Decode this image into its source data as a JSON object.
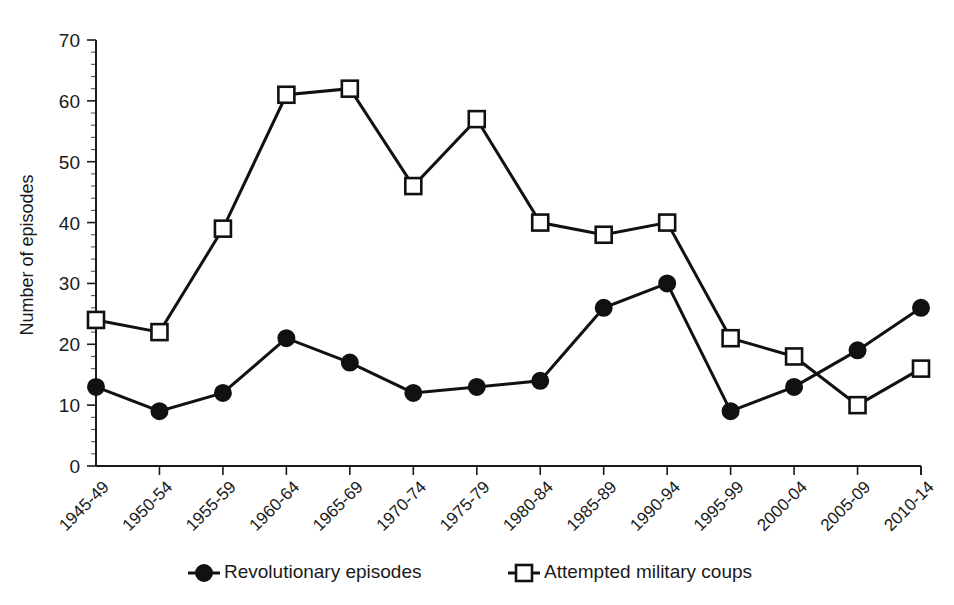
{
  "chart_data": {
    "type": "line",
    "title": "",
    "xlabel": "",
    "ylabel": "Number of episodes",
    "ylim": [
      0,
      70
    ],
    "y_ticks": [
      0,
      10,
      20,
      30,
      40,
      50,
      60,
      70
    ],
    "y_minor_tick_step": 2,
    "grid": false,
    "legend_position": "bottom",
    "categories": [
      "1945-49",
      "1950-54",
      "1955-59",
      "1960-64",
      "1965-69",
      "1970-74",
      "1975-79",
      "1980-84",
      "1985-89",
      "1990-94",
      "1995-99",
      "2000-04",
      "2005-09",
      "2010-14"
    ],
    "series": [
      {
        "name": "Revolutionary episodes",
        "marker": "filled-circle",
        "values": [
          13,
          9,
          12,
          21,
          17,
          12,
          13,
          14,
          26,
          30,
          9,
          13,
          19,
          26
        ]
      },
      {
        "name": "Attempted military coups",
        "marker": "open-square",
        "values": [
          24,
          22,
          39,
          61,
          62,
          46,
          57,
          40,
          38,
          40,
          21,
          18,
          10,
          16
        ]
      }
    ],
    "colors": {
      "line": "#111111",
      "marker_fill_series1": "#111111",
      "marker_fill_series2": "#ffffff",
      "axis": "#1a1a1a",
      "background": "#ffffff"
    }
  },
  "legend": {
    "items": [
      {
        "label": "Revolutionary episodes",
        "marker": "filled-circle"
      },
      {
        "label": "Attempted military coups",
        "marker": "open-square"
      }
    ]
  }
}
